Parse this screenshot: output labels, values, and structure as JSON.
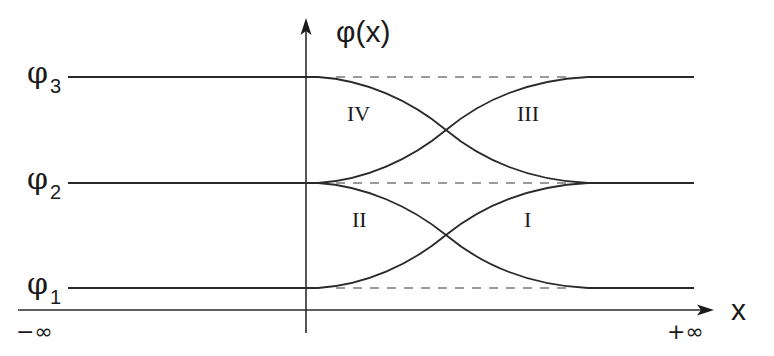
{
  "diagram": {
    "y_axis_label": "φ(x)",
    "x_axis_label": "x",
    "x_min_label": "−∞",
    "x_max_label": "+∞",
    "levels": [
      {
        "symbol": "φ",
        "subscript": "3",
        "y": 77
      },
      {
        "symbol": "φ",
        "subscript": "2",
        "y": 183
      },
      {
        "symbol": "φ",
        "subscript": "1",
        "y": 288
      }
    ],
    "regions": [
      {
        "label": "IV"
      },
      {
        "label": "III"
      },
      {
        "label": "II"
      },
      {
        "label": "I"
      }
    ],
    "colors": {
      "line": "#2a2a2a",
      "dashed": "#7a7a7a",
      "text": "#1a1a1a"
    }
  }
}
